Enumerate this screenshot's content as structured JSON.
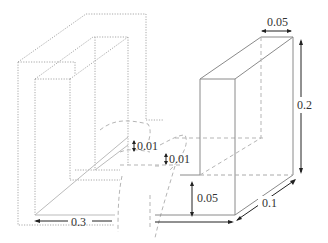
{
  "diagram": {
    "type": "3D isometric U-shaped channel with break lines",
    "dimensions": {
      "top_width": "0.05",
      "height": "0.2",
      "depth": "0.1",
      "base_height": "0.05",
      "length": "0.3",
      "thickness_left": "0.01",
      "thickness_right": "0.01"
    }
  }
}
